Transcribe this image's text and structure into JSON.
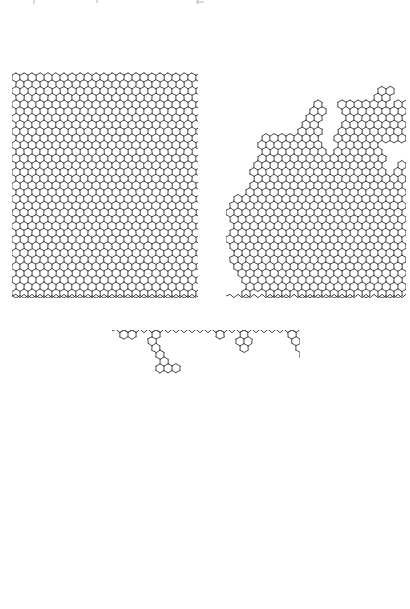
{
  "figure": {
    "kind": "scientific-figure",
    "background_color": "#ffffff",
    "ink_color": "#2e2e2e",
    "width_px": 410,
    "height_px": 609,
    "caption_visible": false,
    "caption_text": "",
    "top_crop_artifact": {
      "present": true,
      "description": "clipped descenders of a cropped text line at the very top edge",
      "color": "#b9b9b9",
      "marks": [
        {
          "x": 33,
          "y": 0,
          "w": 2,
          "h": 4
        },
        {
          "x": 96,
          "y": 0,
          "w": 2,
          "h": 3
        },
        {
          "x": 196,
          "y": 0,
          "w": 3,
          "h": 4
        },
        {
          "x": 198,
          "y": 1,
          "w": 6,
          "h": 2
        }
      ]
    }
  },
  "panels": [
    {
      "id": "panel-a",
      "label": "",
      "position": "top-left",
      "x": 12,
      "y": 12,
      "width": 186,
      "height": 286,
      "substrate_edge": "bottom",
      "growth_direction": "up",
      "coverage": "dense",
      "fill_fraction": 0.93,
      "cluster_count": 1,
      "porosity": "low",
      "seed": 10731,
      "hex": {
        "width": 8.0,
        "height": 9.0,
        "stroke_width": 0.85
      },
      "columns": 24,
      "rows": 33,
      "sticking_probability": 1.0,
      "lateral_bias": 0.5,
      "overhang_amount": 0.18,
      "top_clipped": true
    },
    {
      "id": "panel-b",
      "label": "",
      "position": "top-right",
      "x": 226,
      "y": 12,
      "width": 180,
      "height": 286,
      "substrate_edge": "bottom",
      "growth_direction": "up",
      "coverage": "porous",
      "fill_fraction": 0.55,
      "cluster_count": 1,
      "porosity": "high",
      "seed": 48219,
      "hex": {
        "width": 8.0,
        "height": 9.0,
        "stroke_width": 0.85
      },
      "columns": 23,
      "rows": 33,
      "sticking_probability": 0.55,
      "lateral_bias": 0.44,
      "overhang_amount": 0.42,
      "top_clipped": true
    },
    {
      "id": "panel-c",
      "label": "",
      "position": "bottom-center",
      "x": 112,
      "y": 330,
      "width": 188,
      "height": 279,
      "substrate_edge": "top",
      "growth_direction": "down",
      "coverage": "dendritic",
      "fill_fraction": 0.16,
      "cluster_count": 1,
      "porosity": "very-high",
      "seed": 90317,
      "hex": {
        "width": 8.0,
        "height": 9.0,
        "stroke_width": 0.85
      },
      "columns": 24,
      "rows": 31,
      "sticking_probability": 0.16,
      "lateral_bias": 0.4,
      "overhang_amount": 0.7,
      "bottom_clipped": true
    }
  ],
  "substrates": [
    {
      "panel": "panel-a",
      "orientation": "horizontal",
      "style": "zigzag",
      "x1": 12,
      "x2": 198,
      "y": 296,
      "amplitude": 1.7,
      "period": 8.0
    },
    {
      "panel": "panel-b",
      "orientation": "horizontal",
      "style": "zigzag",
      "x1": 226,
      "x2": 406,
      "y": 296,
      "amplitude": 1.7,
      "period": 8.0
    },
    {
      "panel": "panel-c",
      "orientation": "horizontal",
      "style": "zigzag",
      "x1": 112,
      "x2": 300,
      "y": 331,
      "amplitude": 1.7,
      "period": 8.0
    }
  ],
  "chart_data": {
    "type": "scatter",
    "title": "",
    "xlabel": "",
    "ylabel": "",
    "series": [
      {
        "name": "panel-a compact deposit",
        "fill_fraction": 0.93,
        "sticking_probability": 1.0
      },
      {
        "name": "panel-b porous deposit",
        "fill_fraction": 0.55,
        "sticking_probability": 0.55
      },
      {
        "name": "panel-c dendritic deposit",
        "fill_fraction": 0.16,
        "sticking_probability": 0.16
      }
    ],
    "categories": [
      "panel-a",
      "panel-b",
      "panel-c"
    ],
    "values": [
      0.93,
      0.55,
      0.16
    ],
    "legend_position": "none",
    "grid": false
  }
}
